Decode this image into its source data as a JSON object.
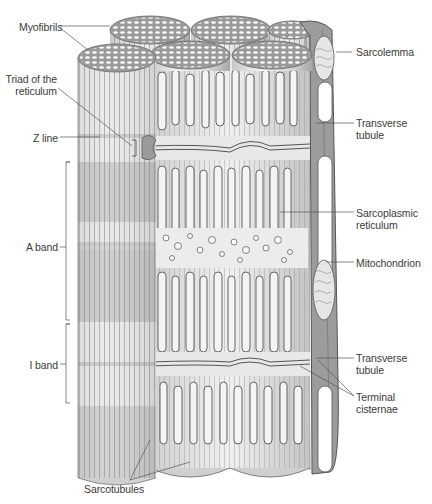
{
  "figure": {
    "colors": {
      "background": "#ffffff",
      "fiber_light": "#e6e6e6",
      "fiber_dark": "#b4b4b4",
      "outline": "#5a5a5a",
      "label_text": "#3a3a3a",
      "leader_line": "#555555"
    }
  },
  "labels": {
    "myofibrils": "Myofibrils",
    "triad_line1": "Triad of the",
    "triad_line2": "reticulum",
    "z_line": "Z line",
    "a_band": "A band",
    "i_band": "I band",
    "sarcolemma": "Sarcolemma",
    "t_tubule_top_line1": "Transverse",
    "t_tubule_top_line2": "tubule",
    "sarcoplasmic_line1": "Sarcoplasmic",
    "sarcoplasmic_line2": "reticulum",
    "mitochondrion": "Mitochondrion",
    "t_tubule_bottom_line1": "Transverse",
    "t_tubule_bottom_line2": "tubule",
    "terminal_line1": "Terminal",
    "terminal_line2": "cisternae",
    "sarcotubules": "Sarcotubules"
  }
}
